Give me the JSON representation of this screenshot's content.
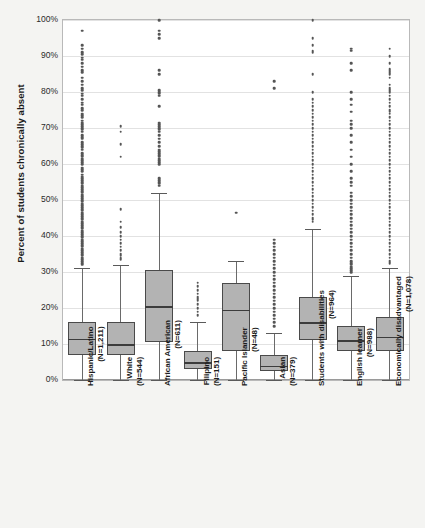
{
  "chart_data": {
    "type": "box",
    "title": "",
    "xlabel": "",
    "ylabel": "Percent of students chronically absent",
    "ylim": [
      0,
      100
    ],
    "ytick_labels": [
      "0%",
      "10%",
      "20%",
      "30%",
      "40%",
      "50%",
      "60%",
      "70%",
      "80%",
      "90%",
      "100%"
    ],
    "ytick_values": [
      0,
      10,
      20,
      30,
      40,
      50,
      60,
      70,
      80,
      90,
      100
    ],
    "grid": true,
    "legend": "none",
    "categories": [
      {
        "name": "Hispanic/Latino",
        "n_label": "(N=1,211)",
        "n": 1211
      },
      {
        "name": "White",
        "n_label": "(N=544)",
        "n": 544
      },
      {
        "name": "African American",
        "n_label": "(N=611)",
        "n": 611
      },
      {
        "name": "Filipino",
        "n_label": "(N=151)",
        "n": 151
      },
      {
        "name": "Pacific Islander",
        "n_label": "(N=48)",
        "n": 48
      },
      {
        "name": "Asian",
        "n_label": "(N=379)",
        "n": 379
      },
      {
        "name": "Students with disabilities",
        "n_label": "(N=964)",
        "n": 964
      },
      {
        "name": "English learner",
        "n_label": "(N=988)",
        "n": 988
      },
      {
        "name": "Economically disadvantaged",
        "n_label": "(N=1,078)",
        "n": 1078
      }
    ],
    "boxes": [
      {
        "category": "Hispanic/Latino",
        "whisker_low": 0,
        "q1": 7,
        "median": 11.5,
        "q3": 16,
        "whisker_high": 31
      },
      {
        "category": "White",
        "whisker_low": 0,
        "q1": 7,
        "median": 10,
        "q3": 16,
        "whisker_high": 32
      },
      {
        "category": "African American",
        "whisker_low": 0,
        "q1": 10.5,
        "median": 20.5,
        "q3": 30.5,
        "whisker_high": 52
      },
      {
        "category": "Filipino",
        "whisker_low": 0,
        "q1": 3,
        "median": 5,
        "q3": 8,
        "whisker_high": 16
      },
      {
        "category": "Pacific Islander",
        "whisker_low": 0,
        "q1": 8,
        "median": 19.5,
        "q3": 27,
        "whisker_high": 33
      },
      {
        "category": "Asian",
        "whisker_low": 0,
        "q1": 2.5,
        "median": 4,
        "q3": 7,
        "whisker_high": 13
      },
      {
        "category": "Students with disabilities",
        "whisker_low": 0,
        "q1": 11,
        "median": 16,
        "q3": 23,
        "whisker_high": 42
      },
      {
        "category": "English learner",
        "whisker_low": 0,
        "q1": 8,
        "median": 11,
        "q3": 15,
        "whisker_high": 29
      },
      {
        "category": "Economically disadvantaged",
        "whisker_low": 0,
        "q1": 8,
        "median": 12,
        "q3": 17.5,
        "whisker_high": 31
      }
    ],
    "outliers": [
      {
        "category": "Hispanic/Latino",
        "values": [
          97,
          93,
          92,
          91,
          90.5,
          89.5,
          89,
          88,
          87,
          86,
          85.5,
          84,
          83,
          82,
          81,
          80.5,
          79.5,
          79,
          78,
          77,
          76.5,
          75.5,
          75,
          74,
          73.5,
          73,
          72,
          71.5,
          71,
          70.5,
          70,
          69.5,
          69,
          68,
          67.5,
          67,
          66,
          65.5,
          65,
          64.5,
          64,
          63,
          62.5,
          62,
          61.5,
          61,
          60.5,
          60,
          59,
          58.5,
          58,
          57,
          56.5,
          56,
          55.5,
          55,
          54.5,
          54,
          53.5,
          53,
          52.5,
          52,
          51.5,
          51,
          50.5,
          50,
          49.5,
          49,
          48.5,
          48,
          47.5,
          47,
          46.5,
          46,
          45.5,
          45,
          44.5,
          44,
          43.5,
          43,
          42.5,
          42,
          41.5,
          41,
          40.5,
          40,
          39.5,
          39,
          38.5,
          38,
          37.5,
          37,
          36.5,
          36,
          35.5,
          35,
          34.5,
          34,
          33.5,
          33,
          32.5,
          32
        ]
      },
      {
        "category": "White",
        "values": [
          70.5,
          69,
          65.5,
          62,
          47.5,
          44,
          42.5,
          41,
          40,
          39,
          38,
          37,
          36,
          35,
          34.5,
          34,
          33.5
        ]
      },
      {
        "category": "African American",
        "values": [
          100,
          97,
          96,
          95,
          86,
          85,
          80.5,
          80,
          79.5,
          79,
          76,
          71.5,
          71,
          70.5,
          70,
          69.5,
          69,
          68,
          67,
          66,
          65,
          64,
          63.5,
          63,
          62.5,
          62,
          61.5,
          61,
          60.5,
          60,
          56,
          55.5,
          55,
          54.5,
          54
        ]
      },
      {
        "category": "Filipino",
        "values": [
          27,
          26,
          25,
          24,
          23,
          22.5,
          22,
          21,
          20,
          19,
          18
        ]
      },
      {
        "category": "Pacific Islander",
        "values": [
          46.5
        ]
      },
      {
        "category": "Asian",
        "values": [
          83,
          81,
          39,
          38,
          37,
          36,
          35,
          34,
          33,
          32,
          31,
          30,
          29,
          28,
          27,
          26,
          25,
          24,
          23,
          22,
          21,
          20,
          19,
          18,
          17,
          16,
          15
        ]
      },
      {
        "category": "Students with disabilities",
        "values": [
          100,
          95,
          93,
          91.5,
          91,
          85,
          80,
          78,
          77,
          76,
          75,
          74,
          73,
          72,
          71,
          70,
          69,
          68,
          67,
          66,
          65,
          64,
          63,
          62,
          61,
          60,
          59,
          58,
          57,
          56,
          55,
          54,
          53,
          52,
          51,
          50,
          49,
          48,
          47,
          46,
          45,
          44.5,
          44
        ]
      },
      {
        "category": "English learner",
        "values": [
          92,
          91.5,
          88,
          86,
          80,
          78,
          76.5,
          74.5,
          72,
          71,
          70,
          68,
          66,
          64,
          62,
          60,
          58,
          56,
          55,
          54,
          52,
          51,
          50,
          49,
          48,
          47,
          46,
          45,
          44,
          43,
          42,
          41,
          40,
          39,
          38,
          37,
          36,
          35,
          34,
          33,
          32.5,
          32,
          31.5,
          31,
          30.5,
          30
        ]
      },
      {
        "category": "Economically disadvantaged",
        "values": [
          92,
          90,
          88,
          86.5,
          86,
          85.5,
          85,
          84,
          82,
          81,
          80.5,
          80,
          79,
          78,
          77,
          76,
          75,
          74.5,
          74,
          73,
          72,
          71,
          70,
          69,
          68,
          67,
          66,
          65,
          64,
          63,
          62,
          61,
          60,
          59,
          58,
          57,
          56,
          55,
          54,
          53,
          52,
          51,
          50,
          49,
          48,
          47,
          46,
          45,
          44,
          43,
          42,
          41,
          40,
          39,
          38,
          37,
          36,
          35,
          34,
          33,
          32.5
        ]
      }
    ]
  },
  "colors": {
    "box_fill": "#b3b3b3",
    "box_stroke": "#4a4a4a",
    "median": "#3c3c3c",
    "grid": "#e2e2e2",
    "plot_bg": "#ffffff",
    "page_bg": "#f4f4f2",
    "outlier": "#555555"
  }
}
